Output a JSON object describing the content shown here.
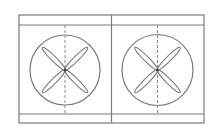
{
  "diagram": {
    "title": "",
    "colors": {
      "background": "#ffffff",
      "stroke": "#7a7a7a",
      "dash": "#8a8a8a",
      "hub": "#444444"
    },
    "frame": {
      "x": 19,
      "y": 15,
      "width": 185,
      "height": 108,
      "header_bottom": 25,
      "footer_top": 114
    },
    "divider_x": 111.5,
    "panels": [
      {
        "name": "fan-panel-left",
        "circle": {
          "cx": 65,
          "cy": 70,
          "r": 35
        },
        "centerline_x": 65,
        "blades": {
          "count": 4,
          "length": 32,
          "width": 5,
          "angles": [
            45,
            135,
            225,
            315
          ]
        }
      },
      {
        "name": "fan-panel-right",
        "circle": {
          "cx": 157.5,
          "cy": 70,
          "r": 35.5
        },
        "centerline_x": 157.5,
        "blades": {
          "count": 4,
          "length": 32,
          "width": 5,
          "angles": [
            45,
            135,
            225,
            315
          ]
        }
      }
    ]
  }
}
